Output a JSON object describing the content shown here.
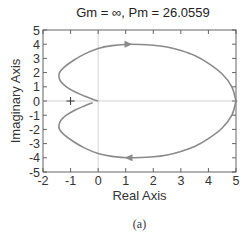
{
  "chart_data": {
    "type": "line",
    "title": "Gm = ∞,  Pm = 26.0559",
    "xlabel": "Real Axis",
    "ylabel": "Imaginary Axis",
    "caption": "(a)",
    "xlim": [
      -2,
      5
    ],
    "ylim": [
      -5,
      5
    ],
    "xticks": [
      -2,
      -1,
      0,
      1,
      2,
      3,
      4,
      5
    ],
    "yticks": [
      5,
      4,
      3,
      2,
      1,
      0,
      -1,
      -2,
      -3,
      -4,
      -5
    ],
    "grid": false,
    "reference_lines": {
      "x0": true,
      "y0": true
    },
    "critical_point": {
      "x": -1,
      "y": 0,
      "marker": "+"
    },
    "series": [
      {
        "name": "Nyquist (upper, w>0 mirrored)",
        "color": "#8a8a8a",
        "points": [
          [
            5.0,
            0.0
          ],
          [
            4.85,
            1.0
          ],
          [
            4.5,
            1.9
          ],
          [
            4.0,
            2.65
          ],
          [
            3.5,
            3.2
          ],
          [
            3.0,
            3.55
          ],
          [
            2.5,
            3.8
          ],
          [
            2.0,
            3.93
          ],
          [
            1.1,
            4.0
          ],
          [
            0.5,
            3.9
          ],
          [
            0.0,
            3.7
          ],
          [
            -0.5,
            3.3
          ],
          [
            -0.9,
            2.85
          ],
          [
            -1.25,
            2.35
          ],
          [
            -1.4,
            2.0
          ],
          [
            -1.42,
            1.7
          ],
          [
            -1.35,
            1.35
          ],
          [
            -1.15,
            1.0
          ],
          [
            -0.85,
            0.65
          ],
          [
            -0.5,
            0.35
          ],
          [
            -0.2,
            0.12
          ],
          [
            0.0,
            0.0
          ]
        ],
        "mirrored": true,
        "arrows": [
          {
            "x": 1.1,
            "y": 4.0,
            "direction": "right"
          },
          {
            "x": 1.1,
            "y": -4.0,
            "direction": "left"
          }
        ]
      }
    ]
  }
}
